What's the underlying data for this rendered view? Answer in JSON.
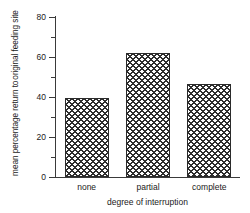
{
  "chart_data": {
    "type": "bar",
    "title": "",
    "subtitle": "",
    "categories": [
      "none",
      "partial",
      "complete"
    ],
    "values": [
      39.5,
      62,
      46.5
    ],
    "series": [
      {
        "name": "mean percentage return to original feeding site",
        "values": [
          39.5,
          62,
          46.5
        ]
      }
    ],
    "xlabel": "degree of interruption",
    "ylabel_line1": "mean percentage return to",
    "ylabel_line2": "original feeding site",
    "ylim": [
      0,
      80
    ],
    "xlim": [
      0,
      3
    ],
    "ytick_labels": [
      "0",
      "20",
      "40",
      "60",
      "80"
    ],
    "ytick_values": [
      0,
      20,
      40,
      60,
      80
    ],
    "yminor_tick_values": [
      10,
      30,
      50,
      70
    ],
    "grid": false,
    "legend": false,
    "legend_position": "none",
    "bar_fill": "#ffffff",
    "bar_hatch": "crosshatch",
    "bar_edge_color": "#2b2b2b",
    "axis_color": "#3a3a3a",
    "background": "#ffffff"
  },
  "axis": {
    "y_label_line1": "mean percentage return to",
    "y_label_line2": "original feeding site",
    "x_label": "degree of interruption"
  },
  "ticks": {
    "y": [
      {
        "label": "80",
        "value": 80
      },
      {
        "label": "60",
        "value": 60
      },
      {
        "label": "40",
        "value": 40
      },
      {
        "label": "20",
        "value": 20
      },
      {
        "label": "0",
        "value": 0
      }
    ]
  },
  "bars": [
    {
      "category": "none",
      "value": 39.5
    },
    {
      "category": "partial",
      "value": 62
    },
    {
      "category": "complete",
      "value": 46.5
    }
  ]
}
